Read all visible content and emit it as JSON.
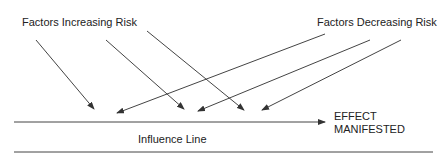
{
  "diagram": {
    "labels": {
      "increasing": "Factors Increasing Risk",
      "decreasing": "Factors Decreasing Risk",
      "influence_line": "Influence Line",
      "effect_line1": "EFFECT",
      "effect_line2": "MANIFESTED"
    },
    "colors": {
      "line": "#333333",
      "background": "#ffffff"
    }
  }
}
